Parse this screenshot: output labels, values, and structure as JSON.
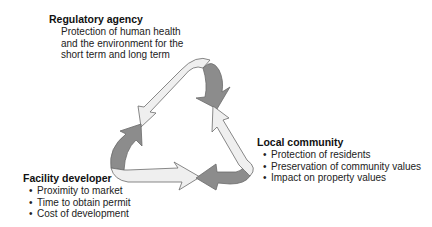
{
  "diagram": {
    "type": "stakeholder-cycle",
    "colors": {
      "arrow_light": "#eeeeee",
      "arrow_dark": "#8a8a8a",
      "outline": "#6b6b6b",
      "text": "#1a1a1a"
    },
    "stakeholders": [
      {
        "id": "regulatory-agency",
        "title": "Regulatory agency",
        "description": "Protection of human health and the environment for the short term and long term",
        "description_lines": [
          "Protection of human health",
          "and the environment for the",
          "short term and long term"
        ]
      },
      {
        "id": "local-community",
        "title": "Local community",
        "bullets": [
          "Protection of residents",
          "Preservation of community values",
          "Impact on property values"
        ]
      },
      {
        "id": "facility-developer",
        "title": "Facility developer",
        "bullets": [
          "Proximity to market",
          "Time to obtain permit",
          "Cost of development"
        ]
      }
    ],
    "bullet_glyph": "•"
  }
}
